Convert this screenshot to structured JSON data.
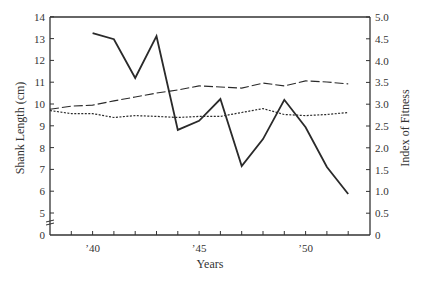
{
  "chart_data": {
    "type": "line",
    "title": "",
    "xlabel": "Years",
    "ylabel_left": "Shank Length  (cm)",
    "ylabel_right": "Index of Fitness",
    "x": [
      1938,
      1939,
      1940,
      1941,
      1942,
      1943,
      1944,
      1945,
      1946,
      1947,
      1948,
      1949,
      1950,
      1951,
      1952
    ],
    "x_tick_labels": [
      {
        "value": 1940,
        "label": "’40"
      },
      {
        "value": 1945,
        "label": "’45"
      },
      {
        "value": 1950,
        "label": "’50"
      }
    ],
    "xlim": [
      1938,
      1952
    ],
    "ylim_left": [
      0,
      14
    ],
    "ylim_right": [
      0,
      5.0
    ],
    "left_axis_break": true,
    "y_ticks_left": [
      "0",
      "5",
      "6",
      "7",
      "8",
      "9",
      "10",
      "11",
      "12",
      "13",
      "14"
    ],
    "y_ticks_right": [
      "0",
      "0.5",
      "1.0",
      "1.5",
      "2.0",
      "2.5",
      "3.0",
      "3.5",
      "4.0",
      "4.5",
      "5.0"
    ],
    "grid": false,
    "legend": null,
    "series": [
      {
        "name": "Index of Fitness",
        "axis": "right",
        "style": "solid",
        "x": [
          1940,
          1941,
          1942,
          1943,
          1944,
          1945,
          1946,
          1947,
          1948,
          1949,
          1950,
          1951,
          1952
        ],
        "values": [
          4.63,
          4.49,
          3.6,
          4.56,
          2.41,
          2.62,
          3.12,
          1.58,
          2.2,
          3.1,
          2.47,
          1.56,
          0.94
        ]
      },
      {
        "name": "Shank Length (upper, dashed)",
        "axis": "left",
        "style": "dashed",
        "x": [
          1938,
          1939,
          1940,
          1941,
          1942,
          1943,
          1944,
          1945,
          1946,
          1947,
          1948,
          1949,
          1950,
          1951,
          1952
        ],
        "values": [
          9.76,
          9.9,
          9.95,
          10.14,
          10.32,
          10.5,
          10.64,
          10.83,
          10.78,
          10.73,
          10.96,
          10.83,
          11.06,
          11.01,
          10.92
        ]
      },
      {
        "name": "Shank Length (lower, dotted)",
        "axis": "left",
        "style": "dotted",
        "x": [
          1938,
          1939,
          1940,
          1941,
          1942,
          1943,
          1944,
          1945,
          1946,
          1947,
          1948,
          1949,
          1950,
          1951,
          1952
        ],
        "values": [
          9.7,
          9.56,
          9.56,
          9.38,
          9.47,
          9.43,
          9.38,
          9.43,
          9.43,
          9.61,
          9.79,
          9.52,
          9.47,
          9.52,
          9.61
        ]
      }
    ]
  }
}
